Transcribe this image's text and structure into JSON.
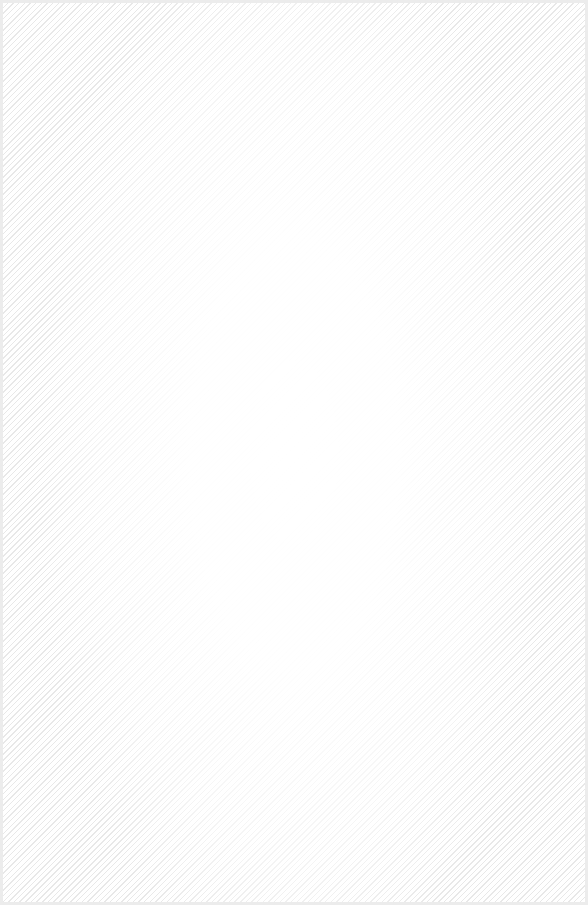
{
  "canvas": {
    "background_color": "#ffffff",
    "border_color": "#ececec",
    "texture": "diagonal-stripes",
    "stripe_color": "#e6e6e6"
  }
}
